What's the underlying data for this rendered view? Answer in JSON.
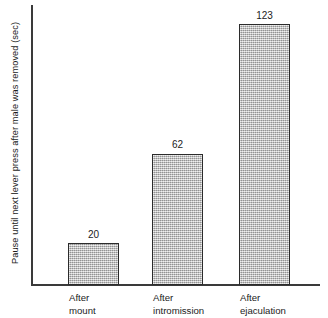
{
  "chart_data": {
    "type": "bar",
    "title": "",
    "subtitle": "",
    "xlabel": "",
    "ylabel": "Pause until next lever press after male was removed (sec)",
    "categories": [
      "After mount",
      "After intromission",
      "After ejaculation"
    ],
    "category_lines": [
      {
        "line1": "After",
        "line2": "mount"
      },
      {
        "line1": "After",
        "line2": "intromission"
      },
      {
        "line1": "After",
        "line2": "ejaculation"
      }
    ],
    "values": [
      20,
      62,
      123
    ],
    "value_labels": [
      "20",
      "62",
      "123"
    ],
    "ylim": [
      0,
      132
    ],
    "xlim": [
      0,
      3
    ],
    "grid": false,
    "legend": null,
    "legend_position": "none",
    "y_ticks": [],
    "y_tick_labels": [],
    "x_ticks": [],
    "annotations": [],
    "colors": {
      "bar_fill": "#b0b0b0",
      "bar_border": "#2b2b2b",
      "axis": "#3a3a3a",
      "text": "#1c1c1c",
      "background": "#ffffff"
    }
  }
}
